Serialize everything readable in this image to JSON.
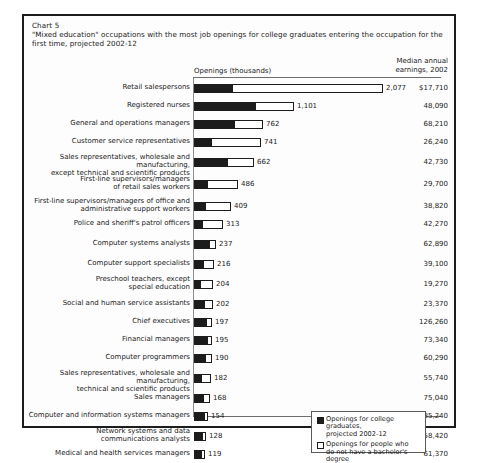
{
  "chart": {
    "number_label": "Chart 5",
    "title": "\"Mixed education\" occupations with the most job openings for college graduates entering the occupation for the first time, projected 2002-12",
    "openings_header": "Openings (thousands)",
    "earnings_header": "Median annual\nearnings, 2002"
  },
  "legend": {
    "items": [
      {
        "swatch": "filled",
        "text": "Openings for college graduates,\nprojected 2002-12"
      },
      {
        "swatch": "hollow",
        "text": "Openings for people who\ndo not have a bachelor's degree"
      }
    ]
  },
  "chart_data": {
    "type": "bar",
    "orientation": "horizontal",
    "stacked": true,
    "title": "\"Mixed education\" occupations with the most job openings for college graduates entering the occupation for the first time, projected 2002-12",
    "xlabel": "Openings (thousands)",
    "ylabel": "",
    "xlim": [
      0,
      2100
    ],
    "grid": false,
    "legend_position": "inside-lower-right",
    "categories": [
      "Retail salespersons",
      "Registered nurses",
      "General and operations managers",
      "Customer service representatives",
      "Sales representatives, wholesale and manufacturing, except technical and scientific products",
      "First-line supervisors/managers of retail sales workers",
      "First-line supervisors/managers of office and administrative support workers",
      "Police and sheriff's patrol officers",
      "Computer systems analysts",
      "Computer support specialists",
      "Preschool teachers, except special education",
      "Social and human service assistants",
      "Chief executives",
      "Financial managers",
      "Computer programmers",
      "Sales representatives, wholesale and manufacturing, technical and scientific products",
      "Sales managers",
      "Computer and information systems managers",
      "Network systems and data communications analysts",
      "Medical and health services managers"
    ],
    "series": [
      {
        "name": "Openings for college graduates, projected 2002-12",
        "color": "#1c1c1c",
        "values": [
          430,
          680,
          450,
          200,
          370,
          150,
          130,
          100,
          180,
          110,
          75,
          120,
          140,
          150,
          130,
          85,
          110,
          125,
          100,
          95
        ]
      },
      {
        "name": "Openings for people who do not have a bachelor's degree",
        "color": "#ffffff",
        "values": [
          1647,
          421,
          312,
          541,
          292,
          336,
          279,
          213,
          57,
          106,
          129,
          82,
          57,
          45,
          60,
          97,
          58,
          29,
          28,
          24
        ]
      }
    ],
    "totals": [
      2077,
      1101,
      762,
      741,
      662,
      486,
      409,
      313,
      237,
      216,
      204,
      202,
      197,
      195,
      190,
      182,
      168,
      154,
      128,
      119
    ],
    "total_labels": [
      "2,077",
      "1,101",
      "762",
      "741",
      "662",
      "486",
      "409",
      "313",
      "237",
      "216",
      "204",
      "202",
      "197",
      "195",
      "190",
      "182",
      "168",
      "154",
      "128",
      "119"
    ],
    "median_annual_earnings_2002": [
      "$17,710",
      "48,090",
      "68,210",
      "26,240",
      "42,730",
      "29,700",
      "38,820",
      "42,270",
      "62,890",
      "39,100",
      "19,270",
      "23,370",
      "126,260",
      "73,340",
      "60,290",
      "55,740",
      "75,040",
      "85,240",
      "58,420",
      "61,370"
    ]
  },
  "rows": [
    {
      "label": "Retail salespersons",
      "lines": 1,
      "total": "2,077",
      "earnings": "$17,710",
      "black_px": 39,
      "white_px": 150
    },
    {
      "label": "Registered nurses",
      "lines": 1,
      "total": "1,101",
      "earnings": "48,090",
      "black_px": 62,
      "white_px": 38
    },
    {
      "label": "General and operations managers",
      "lines": 1,
      "total": "762",
      "earnings": "68,210",
      "black_px": 41,
      "white_px": 28
    },
    {
      "label": "Customer service representatives",
      "lines": 1,
      "total": "741",
      "earnings": "26,240",
      "black_px": 18,
      "white_px": 49
    },
    {
      "label": "Sales representatives, wholesale and manufacturing,\nexcept technical and scientific products",
      "lines": 2,
      "total": "662",
      "earnings": "42,730",
      "black_px": 34,
      "white_px": 26
    },
    {
      "label": "First-line supervisors/managers\nof retail sales workers",
      "lines": 2,
      "total": "486",
      "earnings": "29,700",
      "black_px": 14,
      "white_px": 30
    },
    {
      "label": "First-line supervisors/managers of office and\nadministrative support workers",
      "lines": 2,
      "total": "409",
      "earnings": "38,820",
      "black_px": 12,
      "white_px": 25
    },
    {
      "label": "Police and sheriff's patrol officers",
      "lines": 1,
      "total": "313",
      "earnings": "42,270",
      "black_px": 9,
      "white_px": 20
    },
    {
      "label": "Computer systems analysts",
      "lines": 1,
      "total": "237",
      "earnings": "62,890",
      "black_px": 16,
      "white_px": 6
    },
    {
      "label": "Computer support specialists",
      "lines": 1,
      "total": "216",
      "earnings": "39,100",
      "black_px": 10,
      "white_px": 10
    },
    {
      "label": "Preschool teachers, except\nspecial education",
      "lines": 2,
      "total": "204",
      "earnings": "19,270",
      "black_px": 7,
      "white_px": 12
    },
    {
      "label": "Social and human service assistants",
      "lines": 1,
      "total": "202",
      "earnings": "23,370",
      "black_px": 11,
      "white_px": 8
    },
    {
      "label": "Chief executives",
      "lines": 1,
      "total": "197",
      "earnings": "126,260",
      "black_px": 13,
      "white_px": 5
    },
    {
      "label": "Financial managers",
      "lines": 1,
      "total": "195",
      "earnings": "73,340",
      "black_px": 14,
      "white_px": 4
    },
    {
      "label": "Computer programmers",
      "lines": 1,
      "total": "190",
      "earnings": "60,290",
      "black_px": 12,
      "white_px": 6
    },
    {
      "label": "Sales representatives, wholesale and manufacturing,\ntechnical and scientific products",
      "lines": 2,
      "total": "182",
      "earnings": "55,740",
      "black_px": 8,
      "white_px": 9
    },
    {
      "label": "Sales managers",
      "lines": 1,
      "total": "168",
      "earnings": "75,040",
      "black_px": 10,
      "white_px": 6
    },
    {
      "label": "Computer and information systems managers",
      "lines": 1,
      "total": "154",
      "earnings": "85,240",
      "black_px": 11,
      "white_px": 3
    },
    {
      "label": "Network systems and data\ncommunications analysts",
      "lines": 2,
      "total": "128",
      "earnings": "58,420",
      "black_px": 9,
      "white_px": 3
    },
    {
      "label": "Medical and health services managers",
      "lines": 1,
      "total": "119",
      "earnings": "61,370",
      "black_px": 8,
      "white_px": 3
    }
  ],
  "row_tops": [
    6,
    24,
    42,
    60,
    80,
    102,
    124,
    142,
    162,
    182,
    202,
    222,
    240,
    258,
    276,
    296,
    316,
    334,
    354,
    372
  ]
}
